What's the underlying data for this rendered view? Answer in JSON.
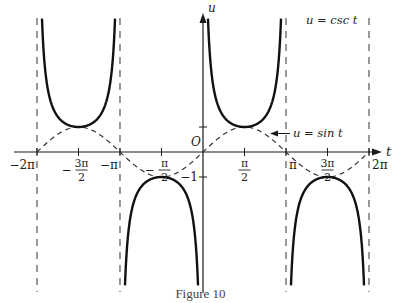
{
  "figure": {
    "caption": "Figure 10",
    "axis_labels": {
      "horizontal": "t",
      "vertical": "u",
      "origin": "O"
    },
    "curve_labels": {
      "csc": "u = csc t",
      "sin": "u = sin t"
    },
    "x_ticks": [
      {
        "label": "−2π",
        "t": -6.2832,
        "type": "plain"
      },
      {
        "label_num": "3π",
        "label_den": "2",
        "sign": "−",
        "t": -4.7124,
        "type": "frac"
      },
      {
        "label": "−π",
        "t": -3.1416,
        "type": "plain"
      },
      {
        "label_num": "π",
        "label_den": "2",
        "sign": "−",
        "t": -1.5708,
        "type": "frac"
      },
      {
        "label_num": "π",
        "label_den": "2",
        "sign": "",
        "t": 1.5708,
        "type": "frac"
      },
      {
        "label": "π",
        "t": 3.1416,
        "type": "plain"
      },
      {
        "label_num": "3π",
        "label_den": "2",
        "sign": "",
        "t": 4.7124,
        "type": "frac"
      },
      {
        "label": "2π",
        "t": 6.2832,
        "type": "plain"
      }
    ],
    "y_ticks": [
      {
        "label": "1",
        "u": 1,
        "shown": false
      },
      {
        "label": "−1",
        "u": -1,
        "shown": true
      }
    ],
    "asymptotes_t": [
      -6.2832,
      -3.1416,
      3.1416,
      6.2832
    ],
    "colors": {
      "ink": "#1a1a1a",
      "dash": "#333333",
      "background": "#ffffff"
    }
  },
  "chart_data": {
    "type": "line",
    "title": "",
    "caption": "Figure 10",
    "xlabel": "t",
    "ylabel": "u",
    "xlim": [
      -6.2832,
      6.2832
    ],
    "ylim": [
      -5.5,
      5.5
    ],
    "x_tick_labels": [
      "−2π",
      "−3π/2",
      "−π",
      "−π/2",
      "π/2",
      "π",
      "3π/2",
      "2π"
    ],
    "y_tick_labels": [
      "1",
      "−1"
    ],
    "series": [
      {
        "name": "u = csc t",
        "style": "solid-thick",
        "function": "csc(t)",
        "key_points": [
          [
            -4.7124,
            1
          ],
          [
            -1.5708,
            -1
          ],
          [
            1.5708,
            1
          ],
          [
            4.7124,
            -1
          ]
        ]
      },
      {
        "name": "u = sin t",
        "style": "dashed",
        "function": "sin(t)",
        "key_points": [
          [
            -6.2832,
            0
          ],
          [
            -4.7124,
            1
          ],
          [
            -3.1416,
            0
          ],
          [
            -1.5708,
            -1
          ],
          [
            0,
            0
          ],
          [
            1.5708,
            1
          ],
          [
            3.1416,
            0
          ],
          [
            4.7124,
            -1
          ],
          [
            6.2832,
            0
          ]
        ]
      }
    ],
    "vertical_asymptotes": [
      -6.2832,
      -3.1416,
      0,
      3.1416,
      6.2832
    ],
    "annotations": [
      "u = csc t",
      "u = sin t",
      "O"
    ],
    "grid": false
  }
}
